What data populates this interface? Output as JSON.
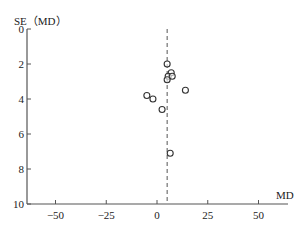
{
  "chart_data": {
    "type": "scatter",
    "subtype": "funnel-plot",
    "title": "",
    "xlabel": "MD",
    "ylabel": "SE（MD）",
    "xlim": [
      -65,
      65
    ],
    "ylim": [
      0,
      10
    ],
    "y_inverted": true,
    "x_ticks": [
      -50,
      -25,
      0,
      25,
      50
    ],
    "x_tick_labels": [
      "−50",
      "−25",
      "0",
      "25",
      "50"
    ],
    "y_ticks": [
      0,
      2,
      4,
      6,
      8,
      10
    ],
    "y_tick_labels": [
      "0",
      "2",
      "4",
      "6",
      "8",
      "10"
    ],
    "grid": false,
    "legend": null,
    "reference_line": {
      "orientation": "vertical",
      "x": 5,
      "style": "dashed"
    },
    "series": [
      {
        "name": "studies",
        "marker": "open-circle",
        "points": [
          {
            "x": 5,
            "y": 2.0
          },
          {
            "x": 7,
            "y": 2.5
          },
          {
            "x": 5.5,
            "y": 2.7
          },
          {
            "x": 7.5,
            "y": 2.7
          },
          {
            "x": 5,
            "y": 2.9
          },
          {
            "x": 14,
            "y": 3.5
          },
          {
            "x": -5,
            "y": 3.8
          },
          {
            "x": -2,
            "y": 4.0
          },
          {
            "x": 2.5,
            "y": 4.6
          },
          {
            "x": 6.5,
            "y": 7.1
          }
        ]
      }
    ]
  },
  "colors": {
    "axis": "#555555",
    "marker": "#333333",
    "text": "#222222"
  }
}
